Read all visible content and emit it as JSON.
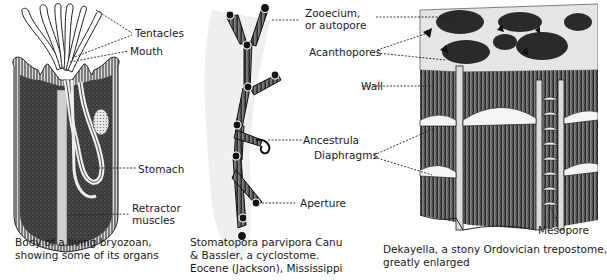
{
  "figures": [
    {
      "id": "living-bryozoan",
      "labels": {
        "tentacles": "Tentacles",
        "mouth": "Mouth",
        "stomach": "Stomach",
        "retractor_1": "Retractor",
        "retractor_2": "muscles"
      },
      "caption": [
        "Body of a living bryozoan,",
        "showing some of its organs"
      ]
    },
    {
      "id": "stomatopora",
      "labels": {
        "zooecium_1": "Zooecium,",
        "zooecium_2": "or autopore",
        "ancestrula": "Ancestrula",
        "aperture": "Aperture"
      },
      "caption": [
        "Stomatopora parvipora Canu",
        "& Bassler, a cyclostome.",
        "Eocene (Jackson), Mississippi"
      ]
    },
    {
      "id": "dekayella",
      "labels": {
        "acanthopores": "Acanthopores",
        "wall": "Wall",
        "diaphragms": "Diaphragms",
        "mesopore": "Mesopore"
      },
      "caption": [
        "Dekayella, a stony Ordovician trepostome,",
        "greatly enlarged"
      ]
    }
  ]
}
